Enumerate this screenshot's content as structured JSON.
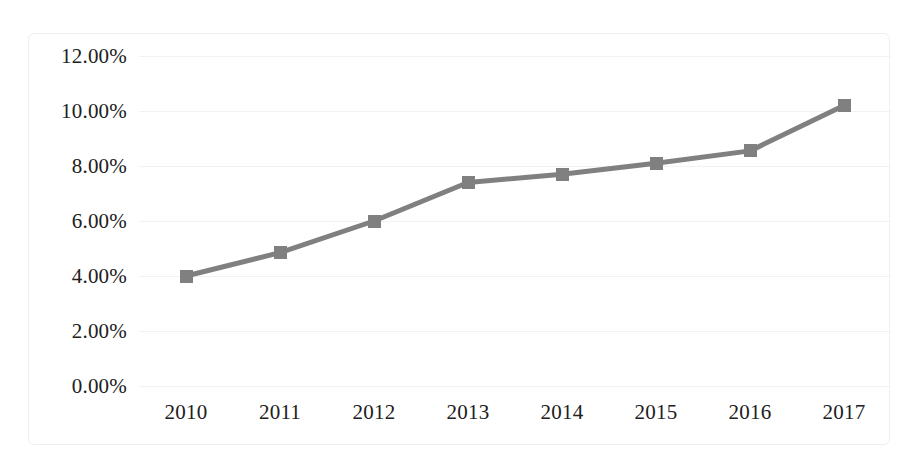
{
  "chart_data": {
    "type": "line",
    "title": "",
    "subtitle": "",
    "xlabel": "",
    "ylabel": "",
    "categories": [
      "2010",
      "2011",
      "2012",
      "2013",
      "2014",
      "2015",
      "2016",
      "2017"
    ],
    "values": [
      4.0,
      4.85,
      6.0,
      7.4,
      7.7,
      8.1,
      8.55,
      10.2
    ],
    "series": [
      {
        "name": "",
        "values": [
          4.0,
          4.85,
          6.0,
          7.4,
          7.7,
          8.1,
          8.55,
          10.2
        ]
      }
    ],
    "ylim": [
      0,
      12
    ],
    "ytick_step": 2,
    "ytick_labels": [
      "0.00%",
      "2.00%",
      "4.00%",
      "6.00%",
      "8.00%",
      "10.00%",
      "12.00%"
    ],
    "ytick_values": [
      0,
      2,
      4,
      6,
      8,
      10,
      12
    ],
    "xtick_labels": [
      "2010",
      "2011",
      "2012",
      "2013",
      "2014",
      "2015",
      "2016",
      "2017"
    ],
    "grid": true,
    "grid_axis": "y",
    "legend": false,
    "legend_position": "none",
    "marker": "square",
    "value_format": "percent",
    "colors": {
      "line": "#808080",
      "marker": "#808080",
      "gridline": "#f2f2f2",
      "text": "#202020",
      "border": "#efefef",
      "background": "#ffffff"
    }
  }
}
